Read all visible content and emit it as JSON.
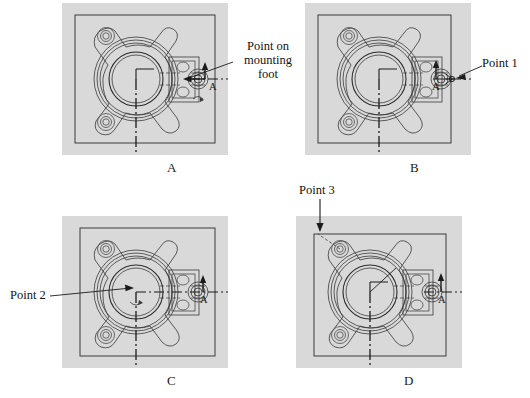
{
  "figure": {
    "kind": "engineering-drawing-multipanel",
    "background_color": "#ffffff",
    "panel_fill": "#d9d9d9",
    "line_color": "#2b2b2b"
  },
  "panels": [
    {
      "id": "A",
      "letter": "A",
      "section_arrow_label": "A",
      "callout": {
        "name": "point-on-mounting-foot",
        "text": "Point on\nmounting\nfoot"
      }
    },
    {
      "id": "B",
      "letter": "B",
      "section_arrow_label": "A",
      "callout": {
        "name": "point-1",
        "text": "Point 1"
      }
    },
    {
      "id": "C",
      "letter": "C",
      "section_arrow_label": "A",
      "callout": {
        "name": "point-2",
        "text": "Point 2"
      }
    },
    {
      "id": "D",
      "letter": "D",
      "section_arrow_label": "A",
      "callout": {
        "name": "point-3",
        "text": "Point 3"
      }
    }
  ]
}
